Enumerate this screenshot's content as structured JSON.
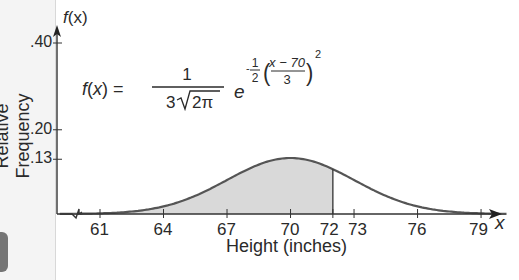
{
  "chart_data": {
    "type": "area",
    "title": "",
    "xlabel": "Height (inches)",
    "ylabel": "Relative Frequency",
    "y_axis_symbol": "f(x)",
    "x_axis_symbol": "x",
    "x_ticks": [
      61,
      64,
      67,
      70,
      72,
      73,
      76,
      79
    ],
    "x_tick_labels": [
      "61",
      "64",
      "67",
      "70",
      "72",
      "73",
      "76",
      "79"
    ],
    "y_ticks": [
      0.13,
      0.2,
      0.4
    ],
    "y_tick_labels": [
      ".13",
      ".20",
      ".40"
    ],
    "distribution": {
      "name": "normal",
      "mean": 70,
      "sd": 3
    },
    "formula": "f(x) = 1/(3√(2π)) · e^(-1/2·((x−70)/3)^2)",
    "shaded_region": {
      "from": 60,
      "to": 72,
      "color": "#d9d9d9"
    },
    "curve_color": "#555555",
    "xlim": [
      60,
      80
    ],
    "axis_break": true,
    "grid": false
  },
  "labels": {
    "y_symbol_f": "f",
    "y_symbol_x": "(x)",
    "x_symbol": "x",
    "xlabel": "Height (inches)",
    "ylabel": "Relative Frequency"
  },
  "formula": {
    "lhs": "f(x) =",
    "num": "1",
    "den_coef": "3",
    "den_root": "2π",
    "base": "e",
    "exp_sign": "-",
    "exp_frac_num": "1",
    "exp_frac_den": "2",
    "inner_num": "x − 70",
    "inner_den": "3",
    "power": "2"
  }
}
